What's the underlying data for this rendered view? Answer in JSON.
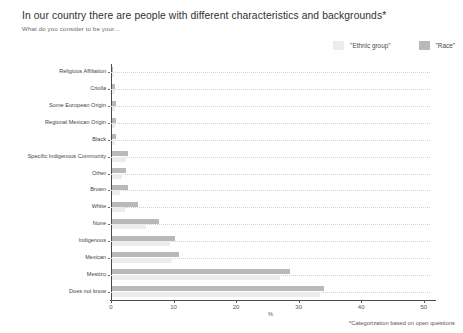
{
  "header": {
    "title": "In our country there are people with different characteristics and backgrounds*",
    "subtitle": "What do you consider to be your..."
  },
  "legend": {
    "items": [
      {
        "label": "\"Ethnic group\"",
        "color": "#ececec",
        "icon": "legend-swatch-ethnic"
      },
      {
        "label": "\"Race\"",
        "color": "#b9b9b9",
        "icon": "legend-swatch-race"
      }
    ]
  },
  "footnote": "*Categorization based on open questions",
  "chart_data": {
    "type": "bar",
    "orientation": "horizontal",
    "title": "In our country there are people with different characteristics and backgrounds*",
    "subtitle": "What do you consider to be your...",
    "xlabel": "%",
    "ylabel": "",
    "xlim": [
      0,
      51
    ],
    "xticks": [
      0,
      10,
      20,
      30,
      40,
      50
    ],
    "xticklabels": [
      "0",
      "10",
      "20",
      "30",
      "40",
      "50"
    ],
    "grid": true,
    "grid_axis": "y",
    "legend_position": "top-right",
    "categories": [
      "Religious Affiliation",
      "Criolla",
      "Some European Origin",
      "Regional Mexican Origin",
      "Black",
      "Specific Indigenous Community",
      "Other",
      "Brown",
      "White",
      "None",
      "Indigenous",
      "Mexican",
      "Mestizo",
      "Does not know"
    ],
    "series": [
      {
        "name": "\"Race\"",
        "color": "#b9b9b9",
        "values": [
          0.2,
          0.5,
          0.6,
          0.6,
          0.6,
          2.5,
          2.3,
          2.6,
          4.2,
          7.5,
          10.0,
          10.7,
          28.4,
          33.9
        ]
      },
      {
        "name": "\"Ethnic group\"",
        "color": "#ececec",
        "values": [
          0.3,
          0.4,
          0.5,
          0.5,
          0.5,
          2.2,
          1.6,
          1.2,
          2.0,
          5.5,
          9.2,
          9.6,
          26.8,
          33.2
        ]
      }
    ]
  }
}
